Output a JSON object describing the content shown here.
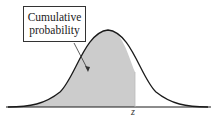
{
  "diagram": {
    "type": "normal-distribution-cumulative-probability",
    "callout": {
      "line1": "Cumulative",
      "line2": "probability"
    },
    "axis_marker": "z",
    "colors": {
      "curve": "#1a1a1a",
      "shade": "#cccccc",
      "box_border": "#333333"
    }
  }
}
